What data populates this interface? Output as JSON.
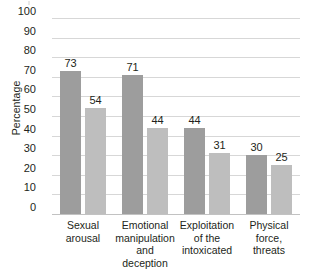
{
  "chart_data": {
    "type": "bar",
    "title": "",
    "xlabel": "",
    "ylabel": "Percentage",
    "ylim": [
      0,
      100
    ],
    "ytick_step": 10,
    "yticks": [
      0,
      10,
      20,
      30,
      40,
      50,
      60,
      70,
      80,
      90,
      100
    ],
    "grid": true,
    "legend": "none",
    "categories": [
      "Sexual arousal",
      "Emotional manipulation and deception",
      "Exploitation of the intoxicated",
      "Physical force, threats"
    ],
    "category_lines": [
      [
        "Sexual",
        "arousal"
      ],
      [
        "Emotional",
        "manipulation",
        "and",
        "deception"
      ],
      [
        "Exploitation",
        "of the",
        "intoxicated"
      ],
      [
        "Physical",
        "force,",
        "threats"
      ]
    ],
    "series": [
      {
        "name": "series-1",
        "color": "#9d9d9d",
        "values": [
          73,
          71,
          44,
          30
        ]
      },
      {
        "name": "series-2",
        "color": "#bebebe",
        "values": [
          54,
          44,
          31,
          25
        ]
      }
    ],
    "value_labels": [
      [
        "73",
        "54"
      ],
      [
        "71",
        "44"
      ],
      [
        "44",
        "31"
      ],
      [
        "30",
        "25"
      ]
    ],
    "colors": {
      "series_1": "#9d9d9d",
      "series_2": "#bebebe",
      "gridline": "#d7d7d7",
      "baseline": "#c2c2c2",
      "text": "#231f20",
      "background": "#ffffff"
    }
  }
}
